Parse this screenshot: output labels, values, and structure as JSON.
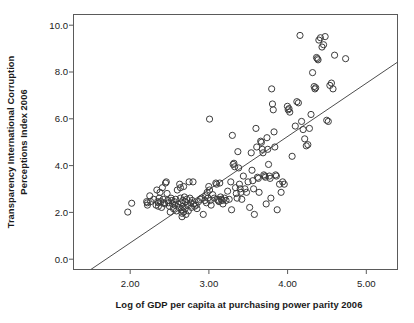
{
  "chart_data": {
    "type": "scatter",
    "title": "",
    "xlabel": "Log of GDP per capita at purchasing power parity 2006",
    "ylabel": "Transparency International Corruption Perceptions Index 2006",
    "ylabel_line1": "Transparency International Corruption",
    "ylabel_line2": "Perceptions Index 2006",
    "xlim": [
      1.28,
      5.4
    ],
    "ylim": [
      -0.47,
      10.5
    ],
    "xticks": [
      2.0,
      3.0,
      4.0,
      5.0
    ],
    "xtick_labels": [
      "2.00",
      "3.00",
      "4.00",
      "5.00"
    ],
    "yticks": [
      0.0,
      2.0,
      4.0,
      6.0,
      8.0,
      10.0
    ],
    "ytick_labels": [
      "0.0",
      "2.0",
      "4.0",
      "6.0",
      "8.0",
      "10.0"
    ],
    "grid": false,
    "legend": null,
    "marker": "open-circle",
    "marker_color": "#3c3c3c",
    "marker_radius_px": 3.1,
    "frame_color": "#5a5a5a",
    "background": "#ffffff",
    "trendline": {
      "type": "linear",
      "slope": 2.29,
      "intercept": -3.9,
      "x_start": 1.5,
      "y_start": -0.47,
      "x_end": 5.4,
      "y_end": 8.45,
      "color": "#4d4d4d"
    },
    "n_points": 178,
    "points": [
      [
        1.97,
        2.0
      ],
      [
        2.02,
        2.38
      ],
      [
        2.21,
        2.45
      ],
      [
        2.22,
        2.4
      ],
      [
        2.22,
        2.3
      ],
      [
        2.25,
        2.7
      ],
      [
        2.26,
        2.45
      ],
      [
        2.3,
        2.55
      ],
      [
        2.33,
        2.3
      ],
      [
        2.34,
        2.95
      ],
      [
        2.35,
        2.45
      ],
      [
        2.36,
        2.4
      ],
      [
        2.36,
        2.25
      ],
      [
        2.37,
        2.6
      ],
      [
        2.38,
        2.85
      ],
      [
        2.39,
        2.45
      ],
      [
        2.4,
        2.2
      ],
      [
        2.41,
        3.05
      ],
      [
        2.42,
        2.55
      ],
      [
        2.43,
        2.4
      ],
      [
        2.44,
        2.35
      ],
      [
        2.45,
        3.25
      ],
      [
        2.46,
        3.3
      ],
      [
        2.47,
        2.8
      ],
      [
        2.48,
        2.5
      ],
      [
        2.49,
        2.4
      ],
      [
        2.5,
        2.25
      ],
      [
        2.51,
        2.0
      ],
      [
        2.52,
        2.6
      ],
      [
        2.53,
        2.5
      ],
      [
        2.54,
        2.35
      ],
      [
        2.55,
        2.15
      ],
      [
        2.56,
        2.45
      ],
      [
        2.57,
        2.3
      ],
      [
        2.58,
        2.55
      ],
      [
        2.59,
        2.05
      ],
      [
        2.6,
        2.95
      ],
      [
        2.61,
        2.35
      ],
      [
        2.62,
        2.2
      ],
      [
        2.63,
        3.2
      ],
      [
        2.64,
        3.05
      ],
      [
        2.64,
        2.6
      ],
      [
        2.65,
        2.4
      ],
      [
        2.65,
        2.1
      ],
      [
        2.66,
        1.95
      ],
      [
        2.66,
        1.8
      ],
      [
        2.67,
        2.5
      ],
      [
        2.67,
        2.25
      ],
      [
        2.68,
        3.1
      ],
      [
        2.68,
        2.0
      ],
      [
        2.69,
        2.65
      ],
      [
        2.7,
        2.45
      ],
      [
        2.7,
        2.15
      ],
      [
        2.71,
        1.9
      ],
      [
        2.72,
        2.55
      ],
      [
        2.73,
        2.3
      ],
      [
        2.74,
        2.05
      ],
      [
        2.75,
        3.3
      ],
      [
        2.76,
        2.6
      ],
      [
        2.77,
        2.4
      ],
      [
        2.78,
        2.2
      ],
      [
        2.79,
        2.5
      ],
      [
        2.8,
        3.3
      ],
      [
        2.81,
        2.35
      ],
      [
        2.82,
        2.25
      ],
      [
        2.84,
        2.3
      ],
      [
        2.85,
        2.15
      ],
      [
        2.87,
        2.45
      ],
      [
        2.89,
        2.55
      ],
      [
        2.91,
        2.6
      ],
      [
        2.93,
        1.9
      ],
      [
        2.95,
        2.5
      ],
      [
        2.96,
        2.7
      ],
      [
        2.97,
        2.4
      ],
      [
        2.98,
        2.85
      ],
      [
        2.99,
        2.6
      ],
      [
        3.0,
        3.1
      ],
      [
        3.01,
        6.0
      ],
      [
        3.01,
        2.95
      ],
      [
        3.02,
        2.5
      ],
      [
        3.03,
        2.3
      ],
      [
        3.05,
        2.75
      ],
      [
        3.07,
        2.6
      ],
      [
        3.09,
        3.25
      ],
      [
        3.1,
        3.2
      ],
      [
        3.11,
        2.55
      ],
      [
        3.12,
        2.5
      ],
      [
        3.13,
        2.45
      ],
      [
        3.14,
        3.25
      ],
      [
        3.15,
        2.65
      ],
      [
        3.16,
        2.55
      ],
      [
        3.17,
        2.5
      ],
      [
        3.18,
        2.35
      ],
      [
        3.2,
        2.6
      ],
      [
        3.22,
        2.5
      ],
      [
        3.24,
        2.9
      ],
      [
        3.26,
        2.55
      ],
      [
        3.28,
        3.3
      ],
      [
        3.29,
        2.1
      ],
      [
        3.3,
        5.3
      ],
      [
        3.31,
        4.05
      ],
      [
        3.32,
        4.1
      ],
      [
        3.33,
        3.95
      ],
      [
        3.34,
        3.05
      ],
      [
        3.35,
        2.8
      ],
      [
        3.36,
        2.6
      ],
      [
        3.37,
        4.6
      ],
      [
        3.38,
        3.9
      ],
      [
        3.39,
        3.2
      ],
      [
        3.4,
        3.0
      ],
      [
        3.41,
        2.85
      ],
      [
        3.42,
        2.55
      ],
      [
        3.44,
        3.55
      ],
      [
        3.46,
        3.0
      ],
      [
        3.48,
        2.85
      ],
      [
        3.5,
        3.3
      ],
      [
        3.52,
        2.2
      ],
      [
        3.54,
        4.55
      ],
      [
        3.55,
        3.8
      ],
      [
        3.56,
        3.35
      ],
      [
        3.57,
        3.0
      ],
      [
        3.58,
        1.9
      ],
      [
        3.6,
        5.6
      ],
      [
        3.61,
        4.8
      ],
      [
        3.62,
        3.5
      ],
      [
        3.63,
        3.45
      ],
      [
        3.64,
        2.85
      ],
      [
        3.66,
        5.05
      ],
      [
        3.67,
        5.0
      ],
      [
        3.68,
        4.7
      ],
      [
        3.69,
        4.55
      ],
      [
        3.7,
        3.6
      ],
      [
        3.71,
        3.55
      ],
      [
        3.72,
        3.5
      ],
      [
        3.73,
        2.35
      ],
      [
        3.74,
        5.2
      ],
      [
        3.75,
        4.7
      ],
      [
        3.76,
        4.05
      ],
      [
        3.77,
        3.55
      ],
      [
        3.78,
        3.45
      ],
      [
        3.79,
        2.6
      ],
      [
        3.8,
        7.3
      ],
      [
        3.81,
        6.65
      ],
      [
        3.82,
        6.4
      ],
      [
        3.83,
        5.45
      ],
      [
        3.84,
        4.8
      ],
      [
        3.85,
        3.6
      ],
      [
        3.86,
        3.55
      ],
      [
        3.87,
        2.1
      ],
      [
        3.9,
        3.2
      ],
      [
        3.92,
        2.85
      ],
      [
        3.94,
        3.3
      ],
      [
        3.96,
        3.2
      ],
      [
        4.0,
        6.55
      ],
      [
        4.01,
        6.4
      ],
      [
        4.02,
        6.45
      ],
      [
        4.03,
        6.3
      ],
      [
        4.06,
        4.4
      ],
      [
        4.1,
        5.7
      ],
      [
        4.12,
        6.75
      ],
      [
        4.14,
        6.7
      ],
      [
        4.16,
        9.6
      ],
      [
        4.18,
        5.9
      ],
      [
        4.2,
        5.55
      ],
      [
        4.22,
        5.15
      ],
      [
        4.24,
        4.85
      ],
      [
        4.26,
        4.9
      ],
      [
        4.28,
        5.6
      ],
      [
        4.3,
        6.2
      ],
      [
        4.32,
        8.0
      ],
      [
        4.34,
        7.4
      ],
      [
        4.35,
        7.3
      ],
      [
        4.36,
        7.35
      ],
      [
        4.37,
        8.65
      ],
      [
        4.38,
        8.6
      ],
      [
        4.39,
        8.55
      ],
      [
        4.4,
        9.4
      ],
      [
        4.42,
        9.5
      ],
      [
        4.44,
        9.1
      ],
      [
        4.46,
        9.2
      ],
      [
        4.48,
        9.55
      ],
      [
        4.5,
        5.95
      ],
      [
        4.52,
        5.9
      ],
      [
        4.54,
        7.45
      ],
      [
        4.56,
        7.55
      ],
      [
        4.58,
        7.3
      ],
      [
        4.6,
        8.75
      ],
      [
        4.74,
        8.6
      ]
    ]
  }
}
